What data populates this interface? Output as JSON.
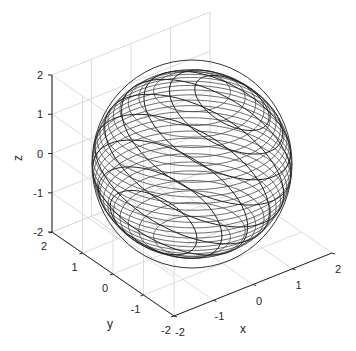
{
  "chart_data": {
    "type": "mesh3d",
    "title": "",
    "xlabel": "x",
    "ylabel": "y",
    "zlabel": "z",
    "xlim": [
      -2,
      2
    ],
    "ylim": [
      -2,
      2
    ],
    "zlim": [
      -2,
      2
    ],
    "x_ticks": [
      "-2",
      "-1",
      "0",
      "1",
      "2"
    ],
    "y_ticks": [
      "2",
      "1",
      "0",
      "-1",
      "-2"
    ],
    "z_ticks": [
      "2",
      "1",
      "0",
      "-1",
      "-2"
    ],
    "grid": true,
    "sphere": {
      "center": [
        0,
        0,
        0
      ],
      "radius": 2
    },
    "line_color": "#333333",
    "grid_color": "#dcdcdc",
    "axis_color": "#262626"
  },
  "axes": {
    "x_label": "x",
    "y_label": "y",
    "z_label": "z",
    "x_ticks": [
      "-2",
      "-1",
      "0",
      "1",
      "2"
    ],
    "y_ticks": [
      "2",
      "1",
      "0",
      "-1",
      "-2"
    ],
    "z_ticks": [
      "2",
      "1",
      "0",
      "-1",
      "-2"
    ]
  }
}
